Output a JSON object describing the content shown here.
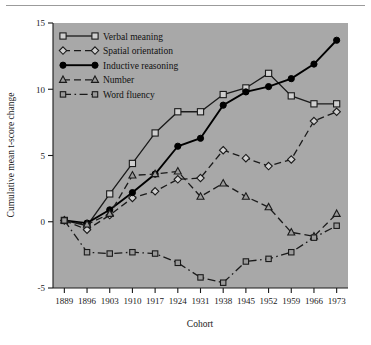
{
  "chart_data": {
    "type": "line",
    "title": "",
    "xlabel": "Cohort",
    "ylabel": "Cumulative mean t-score change",
    "categories": [
      1889,
      1896,
      1903,
      1910,
      1917,
      1924,
      1931,
      1938,
      1945,
      1952,
      1959,
      1966,
      1973
    ],
    "x_tick_labels": [
      "1889",
      "1896",
      "1903",
      "1910",
      "1917",
      "1924",
      "1931",
      "1938",
      "1945",
      "1952",
      "1959",
      "1966",
      "1973"
    ],
    "y_tick_labels": [
      "-5",
      "0",
      "5",
      "10",
      "15"
    ],
    "y_ticks": [
      -5,
      0,
      5,
      10,
      15
    ],
    "ylim": [
      -5,
      15
    ],
    "grid": false,
    "legend_position": "top-left",
    "plot_background": "#a8a8a8",
    "series": [
      {
        "name": "Verbal meaning",
        "marker": "open-square",
        "line": "solid",
        "color": "#1a1a1a",
        "values": [
          0.1,
          -0.3,
          2.1,
          4.4,
          6.7,
          8.3,
          8.3,
          9.6,
          10.1,
          11.2,
          9.5,
          8.9,
          8.9
        ]
      },
      {
        "name": "Spatial orientation",
        "marker": "open-diamond",
        "line": "dashed",
        "color": "#1a1a1a",
        "values": [
          0.1,
          -0.6,
          0.5,
          1.8,
          2.3,
          3.2,
          3.3,
          5.4,
          4.8,
          4.2,
          4.7,
          7.6,
          8.3
        ]
      },
      {
        "name": "Inductive reasoning",
        "marker": "filled-circle",
        "line": "solid",
        "color": "#000000",
        "values": [
          0.1,
          -0.1,
          0.9,
          2.2,
          3.6,
          5.7,
          6.3,
          8.8,
          9.8,
          10.2,
          10.8,
          11.9,
          13.7
        ]
      },
      {
        "name": "Number",
        "marker": "open-triangle",
        "line": "dashed",
        "color": "#1a1a1a",
        "values": [
          0.1,
          -0.2,
          0.6,
          3.5,
          3.6,
          3.8,
          1.9,
          2.9,
          1.9,
          1.1,
          -0.8,
          -1.1,
          0.6
        ]
      },
      {
        "name": "Word fluency",
        "marker": "open-square-small",
        "line": "dashdot",
        "color": "#1a1a1a",
        "values": [
          0.1,
          -2.3,
          -2.4,
          -2.3,
          -2.4,
          -3.1,
          -4.2,
          -4.6,
          -3.0,
          -2.8,
          -2.3,
          -1.2,
          -0.3
        ]
      }
    ]
  },
  "legend": {
    "items": [
      {
        "label": "Verbal meaning"
      },
      {
        "label": "Spatial orientation"
      },
      {
        "label": "Inductive reasoning"
      },
      {
        "label": "Number"
      },
      {
        "label": "Word fluency"
      }
    ]
  }
}
